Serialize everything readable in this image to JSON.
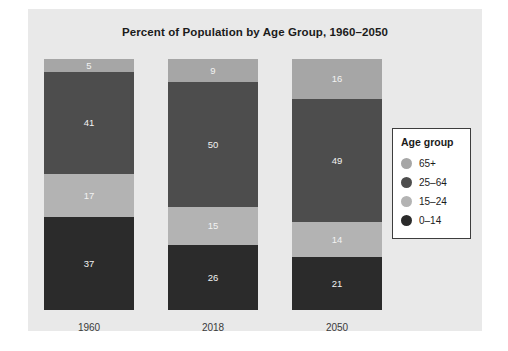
{
  "figure": {
    "background_color": "#ffffff",
    "panel_color": "#e9e9e9"
  },
  "chart_data": {
    "type": "bar",
    "subtype": "stacked-bar-100",
    "title": "Percent of Population by Age Group, 1960–2050",
    "subtitle": "",
    "xlabel": "",
    "ylabel": "",
    "categories": [
      "1960",
      "2018",
      "2050"
    ],
    "ylim": [
      0,
      100
    ],
    "grid": false,
    "legend_position": "right",
    "legend_title": "Age group",
    "stack_order_top_to_bottom": [
      "65+",
      "25–64",
      "15–24",
      "0–14"
    ],
    "series": [
      {
        "name": "65+",
        "color": "#a6a6a6",
        "values": [
          5,
          9,
          16
        ]
      },
      {
        "name": "25–64",
        "color": "#4d4d4d",
        "values": [
          41,
          50,
          49
        ]
      },
      {
        "name": "15–24",
        "color": "#b3b3b3",
        "values": [
          17,
          15,
          14
        ]
      },
      {
        "name": "0–14",
        "color": "#2b2b2b",
        "values": [
          37,
          26,
          21
        ]
      }
    ],
    "bars": [
      {
        "category": "1960",
        "segments": [
          {
            "name": "65+",
            "value": 5,
            "label": "5",
            "color": "#a6a6a6"
          },
          {
            "name": "25–64",
            "value": 41,
            "label": "41",
            "color": "#4d4d4d"
          },
          {
            "name": "15–24",
            "value": 17,
            "label": "17",
            "color": "#b3b3b3"
          },
          {
            "name": "0–14",
            "value": 37,
            "label": "37",
            "color": "#2b2b2b"
          }
        ]
      },
      {
        "category": "2018",
        "segments": [
          {
            "name": "65+",
            "value": 9,
            "label": "9",
            "color": "#a6a6a6"
          },
          {
            "name": "25–64",
            "value": 50,
            "label": "50",
            "color": "#4d4d4d"
          },
          {
            "name": "15–24",
            "value": 15,
            "label": "15",
            "color": "#b3b3b3"
          },
          {
            "name": "0–14",
            "value": 26,
            "label": "26",
            "color": "#2b2b2b"
          }
        ]
      },
      {
        "category": "2050",
        "segments": [
          {
            "name": "65+",
            "value": 16,
            "label": "16",
            "color": "#a6a6a6"
          },
          {
            "name": "25–64",
            "value": 49,
            "label": "49",
            "color": "#4d4d4d"
          },
          {
            "name": "15–24",
            "value": 14,
            "label": "14",
            "color": "#b3b3b3"
          },
          {
            "name": "0–14",
            "value": 21,
            "label": "21",
            "color": "#2b2b2b"
          }
        ]
      }
    ]
  },
  "legend": {
    "title": "Age group",
    "items": [
      {
        "label": "65+",
        "color": "#a6a6a6"
      },
      {
        "label": "25–64",
        "color": "#4d4d4d"
      },
      {
        "label": "15–24",
        "color": "#b3b3b3"
      },
      {
        "label": "0–14",
        "color": "#2b2b2b"
      }
    ]
  }
}
